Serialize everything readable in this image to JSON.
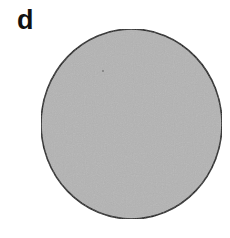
{
  "panel": {
    "label": "d"
  },
  "shape": {
    "type": "circle",
    "fill_color": "#b4b4b4",
    "stroke_color": "#1a1a1a",
    "center_x": 131.5,
    "center_y": 124,
    "radius_x": 90.5,
    "radius_y": 95
  },
  "colors": {
    "background": "#ffffff",
    "fill": "#b4b4b4",
    "outline": "#1a1a1a",
    "label": "#111111"
  }
}
